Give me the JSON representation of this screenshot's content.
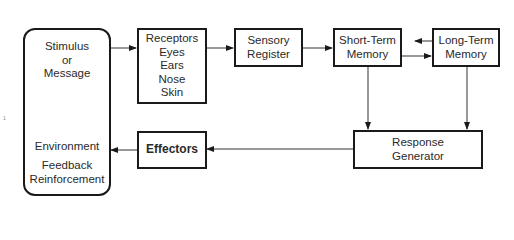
{
  "diagram": {
    "environment_box": {
      "top_lines": [
        "Stimulus",
        "or",
        "Message"
      ],
      "bottom_lines": [
        "Environment",
        "Feedback",
        "Reinforcement"
      ]
    },
    "receptors_box": {
      "lines": [
        "Receptors",
        "Eyes",
        "Ears",
        "Nose",
        "Skin"
      ]
    },
    "sensory_register_box": {
      "lines": [
        "Sensory",
        "Register"
      ]
    },
    "short_term_memory_box": {
      "lines": [
        "Short-Term",
        "Memory"
      ]
    },
    "long_term_memory_box": {
      "lines": [
        "Long-Term",
        "Memory"
      ]
    },
    "response_generator_box": {
      "lines": [
        "Response",
        "Generator"
      ]
    },
    "effectors_box": {
      "label": "Effectors"
    },
    "margin_mark": "1",
    "edges": [
      {
        "from": "environment",
        "to": "receptors"
      },
      {
        "from": "receptors",
        "to": "sensory_register"
      },
      {
        "from": "sensory_register",
        "to": "short_term_memory"
      },
      {
        "from": "short_term_memory",
        "to": "long_term_memory"
      },
      {
        "from": "long_term_memory",
        "to": "short_term_memory"
      },
      {
        "from": "short_term_memory",
        "to": "response_generator"
      },
      {
        "from": "long_term_memory",
        "to": "response_generator"
      },
      {
        "from": "response_generator",
        "to": "effectors"
      },
      {
        "from": "effectors",
        "to": "environment"
      }
    ],
    "colors": {
      "stroke": "#1a1a1a",
      "text": "#2a2a2a",
      "background": "#ffffff"
    }
  }
}
